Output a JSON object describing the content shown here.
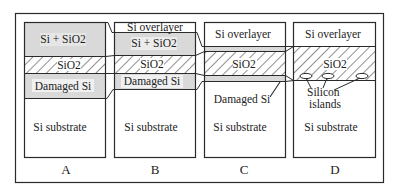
{
  "figure": {
    "panels": [
      {
        "id": "A",
        "label": "A",
        "layers": [
          {
            "name": "si-sio2",
            "text": "Si + SiO2"
          },
          {
            "name": "sio2",
            "text": "SiO2"
          },
          {
            "name": "damaged-si",
            "text": "Damaged Si"
          },
          {
            "name": "si-substrate",
            "text": "Si substrate"
          }
        ]
      },
      {
        "id": "B",
        "label": "B",
        "layers": [
          {
            "name": "si-overlayer",
            "text": "Si overlayer"
          },
          {
            "name": "si-sio2",
            "text": "Si + SiO2"
          },
          {
            "name": "sio2",
            "text": "SiO2"
          },
          {
            "name": "damaged-si",
            "text": "Damaged Si"
          },
          {
            "name": "si-substrate",
            "text": "Si substrate"
          }
        ]
      },
      {
        "id": "C",
        "label": "C",
        "layers": [
          {
            "name": "si-overlayer",
            "text": "Si overlayer"
          },
          {
            "name": "sio2",
            "text": "SiO2"
          },
          {
            "name": "damaged-si",
            "text": "Damaged Si"
          },
          {
            "name": "si-substrate",
            "text": "Si substrate"
          }
        ]
      },
      {
        "id": "D",
        "label": "D",
        "layers": [
          {
            "name": "si-overlayer",
            "text": "Si overlayer"
          },
          {
            "name": "sio2",
            "text": "SiO2"
          },
          {
            "name": "silicon-islands",
            "text_line1": "Silicon",
            "text_line2": "islands"
          },
          {
            "name": "si-substrate",
            "text": "Si substrate"
          }
        ]
      }
    ],
    "colors": {
      "frame": "#2a2a2a",
      "grey_fill": "#d9d9d9",
      "hatch": "#333333",
      "background": "#ffffff"
    }
  }
}
